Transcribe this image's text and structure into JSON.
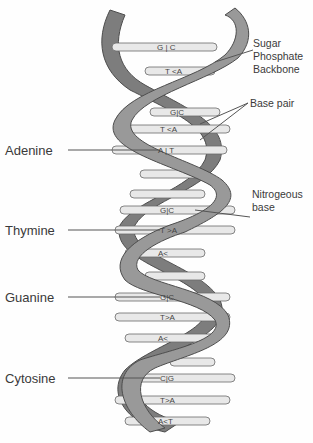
{
  "diagram": {
    "labels_left": [
      {
        "id": "adenine",
        "text": "Adenine",
        "y": 150
      },
      {
        "id": "thymine",
        "text": "Thymine",
        "y": 230
      },
      {
        "id": "guanine",
        "text": "Guanine",
        "y": 297
      },
      {
        "id": "cytosine",
        "text": "Cytosine",
        "y": 378
      }
    ],
    "labels_right": {
      "backbone": [
        "Sugar",
        "Phosphate",
        "Backbone"
      ],
      "base_pair": "Base pair",
      "nitrogenous_base": [
        "Nitrogeous",
        "base"
      ]
    },
    "base_pairs": [
      {
        "text": "G|C",
        "y": 47
      },
      {
        "text": "T<A",
        "y": 71
      },
      {
        "text": "G|C",
        "y": 112
      },
      {
        "text": "T<A",
        "y": 129
      },
      {
        "text": "A|T",
        "y": 150
      },
      {
        "text": "G|C",
        "y": 210
      },
      {
        "text": "T>A",
        "y": 230
      },
      {
        "text": "A<C",
        "y": 253
      },
      {
        "text": "G|C",
        "y": 297
      },
      {
        "text": "T>A",
        "y": 317
      },
      {
        "text": "A<C",
        "y": 338
      },
      {
        "text": "C|G",
        "y": 378
      },
      {
        "text": "T>A",
        "y": 400
      },
      {
        "text": "A<T",
        "y": 421
      }
    ],
    "colors": {
      "ribbon": "#8c8c8c",
      "ribbon_edge": "#555555",
      "rung": "#e6e6e6",
      "text": "#3a3a3a"
    }
  }
}
